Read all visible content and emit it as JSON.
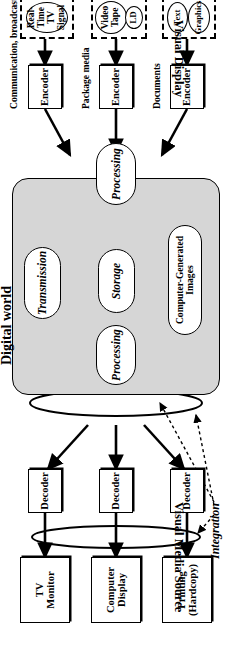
{
  "figure": {
    "digital_world_label": "Digital world",
    "integration_label": "Integration",
    "side_labels": {
      "top": "Visual Display",
      "bottom": "Visual Media Source"
    }
  },
  "displays": [
    {
      "name": "tv-monitor",
      "line1": "TV",
      "line2": "Monitor"
    },
    {
      "name": "computer-display",
      "line1": "Computer",
      "line2": "Display"
    },
    {
      "name": "printing",
      "line1": "Printing",
      "line2": "(Hardcopy)"
    }
  ],
  "decoders": [
    {
      "label": "Decoder"
    },
    {
      "label": "Decoder"
    },
    {
      "label": "Decoder"
    }
  ],
  "encoders": [
    {
      "label": "Encoder"
    },
    {
      "label": "Encoder"
    },
    {
      "label": "Encoder"
    }
  ],
  "digital_nodes": {
    "processing_top": "Processing",
    "processing_bottom": "Processing",
    "transmission": "Transmission",
    "storage": "Storage",
    "cgi": "Computer-Generated Images"
  },
  "source_groups": [
    {
      "name": "communication-broadcast",
      "label": "Communication, broadcast",
      "items": [
        {
          "line1": "Real-Time",
          "line2": "TV Signal"
        }
      ]
    },
    {
      "name": "package-media",
      "label": "Package media",
      "items": [
        {
          "line1": "Video Tape",
          "line2": ""
        },
        {
          "line1": "LD",
          "line2": ""
        }
      ]
    },
    {
      "name": "documents",
      "label": "Documents",
      "items": [
        {
          "line1": "Text",
          "line2": ""
        },
        {
          "line1": "Graphics",
          "line2": ""
        }
      ]
    }
  ],
  "colors": {
    "panel_fill": "#d6d6d6",
    "stroke": "#000000",
    "background": "#ffffff"
  }
}
